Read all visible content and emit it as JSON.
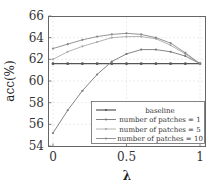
{
  "chart_data": {
    "type": "line",
    "title": "",
    "xlabel": "λ",
    "ylabel": "acc(%)",
    "xlim": [
      0,
      1
    ],
    "ylim": [
      54,
      66
    ],
    "xticks": [
      0,
      0.5,
      1
    ],
    "xtick_labels": [
      "0",
      "0.5",
      "1"
    ],
    "yticks": [
      54,
      56,
      58,
      60,
      62,
      64,
      66
    ],
    "ytick_labels": [
      "54",
      "56",
      "58",
      "60",
      "62",
      "64",
      "66"
    ],
    "grid": true,
    "legend_position": "lower right",
    "x": [
      0,
      0.1,
      0.2,
      0.3,
      0.4,
      0.5,
      0.6,
      0.7,
      0.8,
      0.9,
      1.0
    ],
    "series": [
      {
        "name": "baseline",
        "color": "#555555",
        "values": [
          61.6,
          61.6,
          61.6,
          61.6,
          61.6,
          61.6,
          61.6,
          61.6,
          61.6,
          61.6,
          61.6
        ]
      },
      {
        "name": "number of patches = 1",
        "color": "#777777",
        "values": [
          55.2,
          57.3,
          59.1,
          60.6,
          61.8,
          62.5,
          62.9,
          62.9,
          62.7,
          62.3,
          61.6
        ]
      },
      {
        "name": "number of patches = 5",
        "color": "#aaaaaa",
        "values": [
          62.0,
          62.7,
          63.2,
          63.6,
          64.0,
          64.1,
          64.1,
          63.9,
          63.3,
          62.5,
          61.6
        ]
      },
      {
        "name": "number of patches = 10",
        "color": "#888888",
        "values": [
          63.0,
          63.4,
          63.8,
          64.1,
          64.3,
          64.4,
          64.3,
          64.0,
          63.5,
          62.6,
          61.6
        ]
      }
    ]
  }
}
